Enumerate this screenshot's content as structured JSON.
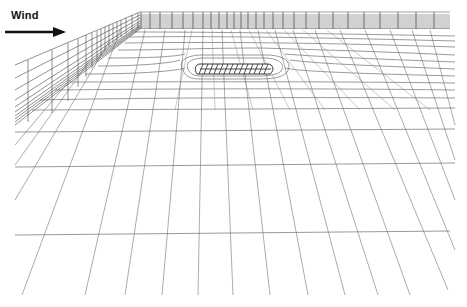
{
  "figure": {
    "wind_label": "Wind",
    "arrow_direction": "right",
    "colors": {
      "background": "#ffffff",
      "grid_line": "#555555",
      "grid_line_faint": "#9a9a9a",
      "block_hatch": "#222222",
      "text": "#111111"
    }
  }
}
